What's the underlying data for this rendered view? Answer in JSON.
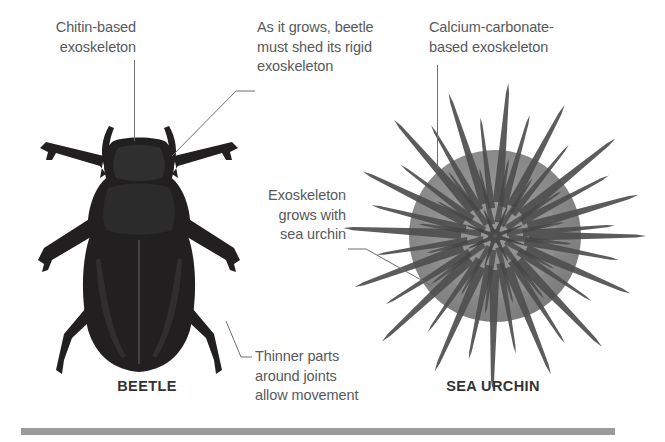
{
  "figure": {
    "background_color": "#ffffff",
    "text_color": "#58595b",
    "caption_color": "#333333",
    "leader_line_color": "#6e6f71",
    "rule_color": "#9b9b9b"
  },
  "annotations": {
    "chitin": {
      "text": "Chitin-based\nexoskeleton",
      "align": "right"
    },
    "shed": {
      "text": "As it grows, beetle\nmust shed its rigid\nexoskeleton",
      "align": "left"
    },
    "calcium": {
      "text": "Calcium-carbonate-\nbased exoskeleton",
      "align": "left"
    },
    "grows": {
      "text": "Exoskeleton\ngrows with\nsea urchin",
      "align": "right"
    },
    "joints": {
      "text": "Thinner parts\naround joints\nallow movement",
      "align": "left"
    }
  },
  "captions": {
    "beetle": "BEETLE",
    "sea_urchin": "SEA URCHIN"
  },
  "illustrations": {
    "beetle": {
      "name": "beetle-illustration",
      "fill": "#221f20"
    },
    "sea_urchin": {
      "name": "sea-urchin-illustration",
      "body_fill": "#8a8a8a",
      "spine_fill": "#4d4d4d"
    }
  }
}
